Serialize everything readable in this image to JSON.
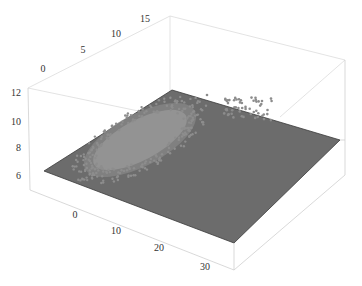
{
  "chart_data": {
    "type": "scatter3d",
    "title": "",
    "xlabel": "",
    "ylabel": "",
    "zlabel": "",
    "x_ticks": [
      "0",
      "10",
      "20",
      "30"
    ],
    "y_ticks": [
      "0",
      "5",
      "10",
      "15"
    ],
    "z_ticks": [
      "6",
      "8",
      "10",
      "12"
    ],
    "xlim": [
      -8,
      35
    ],
    "ylim": [
      -3,
      18
    ],
    "zlim": [
      5.5,
      12
    ],
    "plane": {
      "z": 7,
      "color": "#6e6e6e",
      "description": "flat fitted plane"
    },
    "series": [
      {
        "name": "main cluster",
        "color": "#8f8f8f",
        "center": {
          "x": 6,
          "y": 4,
          "z": 7.1
        },
        "spread": {
          "x": 7,
          "y": 3,
          "z": 0.3
        },
        "approx_count": 1500
      },
      {
        "name": "outlier cluster",
        "color": "#8a8a8a",
        "center": {
          "x": 28,
          "y": 13,
          "z": 8.4
        },
        "spread": {
          "x": 3,
          "y": 2,
          "z": 0.6
        },
        "approx_count": 50
      }
    ],
    "grid": false,
    "box": true
  },
  "colors": {
    "plane": "#6c6c6c",
    "plane_edge": "#333333",
    "cluster_fill": "#929292",
    "cluster_halo": "#848484",
    "outliers": "#8c8c8c",
    "box": "#d6d6d6",
    "axis": "#bdbdbd"
  }
}
